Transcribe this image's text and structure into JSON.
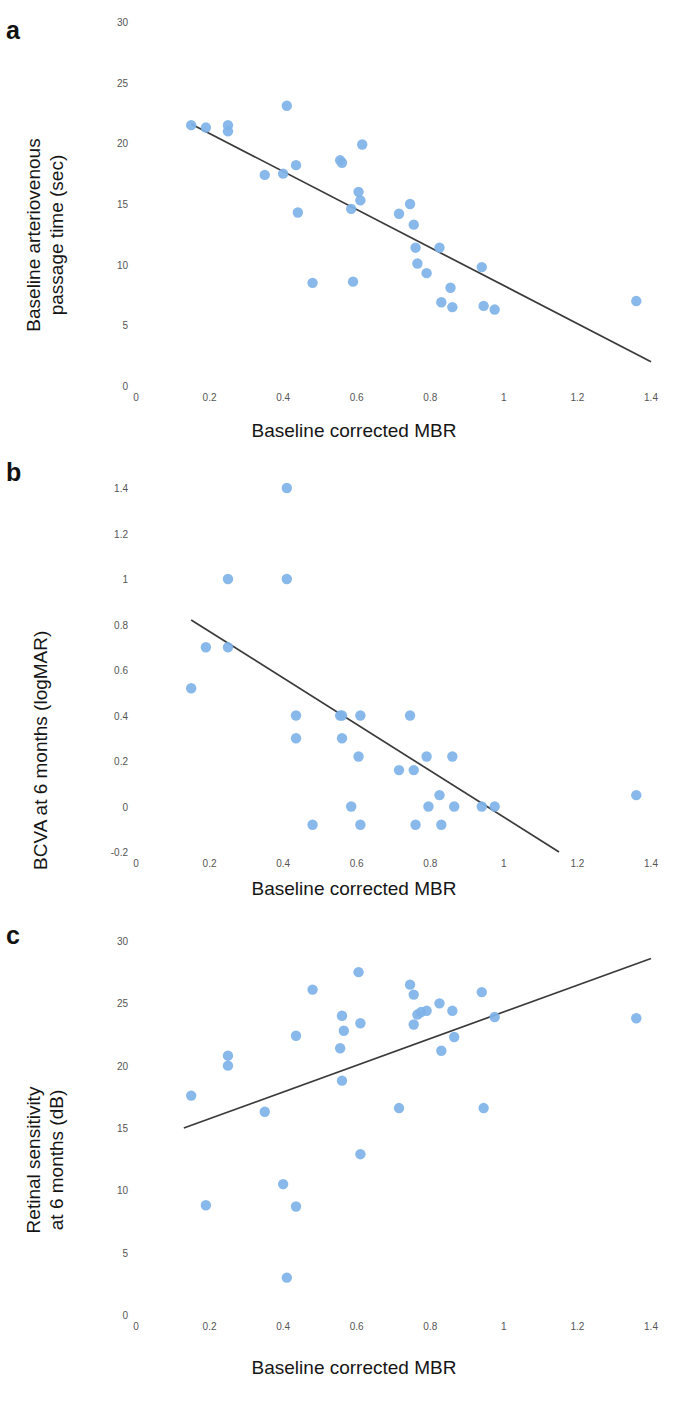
{
  "figure": {
    "marker_color": "#7FB3E8",
    "line_color": "#3a3a3a",
    "tick_color": "#555555",
    "text_color": "#151515"
  },
  "panels": [
    {
      "label": "a",
      "name": "panel-a",
      "chart_data": {
        "type": "scatter",
        "title": "",
        "xlabel": "Baseline corrected MBR",
        "ylabel": "Baseline arteriovenous passage time (sec)",
        "ylabel_lines": [
          "Baseline arteriovenous",
          "passage time (sec)"
        ],
        "xlim": [
          0,
          1.4
        ],
        "ylim": [
          0,
          30
        ],
        "xticks": [
          0,
          0.2,
          0.4,
          0.6,
          0.8,
          1,
          1.2,
          1.4
        ],
        "xticklabels": [
          "0",
          "0.2",
          "0.4",
          "0.6",
          "0.8",
          "1",
          "1.2",
          "1.4"
        ],
        "yticks": [
          0,
          5,
          10,
          15,
          20,
          25,
          30
        ],
        "yticklabels": [
          "0",
          "5",
          "10",
          "15",
          "20",
          "25",
          "30"
        ],
        "grid": false,
        "legend": "none",
        "points": [
          [
            0.15,
            21.5
          ],
          [
            0.19,
            21.3
          ],
          [
            0.25,
            21.5
          ],
          [
            0.25,
            21.0
          ],
          [
            0.35,
            17.4
          ],
          [
            0.4,
            17.5
          ],
          [
            0.41,
            23.1
          ],
          [
            0.435,
            18.2
          ],
          [
            0.44,
            14.3
          ],
          [
            0.48,
            8.5
          ],
          [
            0.555,
            18.6
          ],
          [
            0.56,
            18.4
          ],
          [
            0.585,
            14.6
          ],
          [
            0.59,
            8.6
          ],
          [
            0.605,
            16.0
          ],
          [
            0.61,
            15.3
          ],
          [
            0.615,
            19.9
          ],
          [
            0.715,
            14.2
          ],
          [
            0.745,
            15.0
          ],
          [
            0.755,
            13.3
          ],
          [
            0.76,
            11.4
          ],
          [
            0.765,
            10.1
          ],
          [
            0.79,
            9.3
          ],
          [
            0.825,
            11.4
          ],
          [
            0.83,
            6.9
          ],
          [
            0.855,
            8.1
          ],
          [
            0.86,
            6.5
          ],
          [
            0.94,
            9.8
          ],
          [
            0.945,
            6.6
          ],
          [
            0.975,
            6.3
          ],
          [
            1.36,
            7.0
          ]
        ],
        "fit_line": {
          "x1": 0.15,
          "y1": 21.6,
          "x2": 1.4,
          "y2": 2.0
        }
      }
    },
    {
      "label": "b",
      "name": "panel-b",
      "chart_data": {
        "type": "scatter",
        "title": "",
        "xlabel": "Baseline corrected MBR",
        "ylabel": "BCVA at 6 months (logMAR)",
        "ylabel_lines": [
          "BCVA at 6 months (logMAR)"
        ],
        "xlim": [
          0,
          1.4
        ],
        "ylim": [
          -0.2,
          1.4
        ],
        "xticks": [
          0,
          0.2,
          0.4,
          0.6,
          0.8,
          1,
          1.2,
          1.4
        ],
        "xticklabels": [
          "0",
          "0.2",
          "0.4",
          "0.6",
          "0.8",
          "1",
          "1.2",
          "1.4"
        ],
        "yticks": [
          -0.2,
          0,
          0.2,
          0.4,
          0.6,
          0.8,
          1,
          1.2,
          1.4
        ],
        "yticklabels": [
          "-0.2",
          "0",
          "0.2",
          "0.4",
          "0.6",
          "0.8",
          "1",
          "1.2",
          "1.4"
        ],
        "grid": false,
        "legend": "none",
        "points": [
          [
            0.15,
            0.52
          ],
          [
            0.19,
            0.7
          ],
          [
            0.25,
            1.0
          ],
          [
            0.25,
            0.7
          ],
          [
            0.41,
            1.4
          ],
          [
            0.41,
            1.0
          ],
          [
            0.435,
            0.4
          ],
          [
            0.435,
            0.3
          ],
          [
            0.48,
            -0.08
          ],
          [
            0.555,
            0.4
          ],
          [
            0.56,
            0.4
          ],
          [
            0.56,
            0.3
          ],
          [
            0.585,
            0.0
          ],
          [
            0.605,
            0.22
          ],
          [
            0.61,
            0.4
          ],
          [
            0.61,
            -0.08
          ],
          [
            0.715,
            0.16
          ],
          [
            0.745,
            0.4
          ],
          [
            0.755,
            0.16
          ],
          [
            0.76,
            -0.08
          ],
          [
            0.79,
            0.22
          ],
          [
            0.795,
            0.0
          ],
          [
            0.825,
            0.05
          ],
          [
            0.83,
            -0.08
          ],
          [
            0.86,
            0.22
          ],
          [
            0.865,
            0.0
          ],
          [
            0.94,
            0.0
          ],
          [
            0.975,
            0.0
          ],
          [
            1.36,
            0.05
          ]
        ],
        "fit_line": {
          "x1": 0.15,
          "y1": 0.82,
          "x2": 1.15,
          "y2": -0.2
        }
      }
    },
    {
      "label": "c",
      "name": "panel-c",
      "chart_data": {
        "type": "scatter",
        "title": "",
        "xlabel": "Baseline corrected MBR",
        "ylabel": "Retinal sensitivity at 6 months (dB)",
        "ylabel_lines": [
          "Retinal sensitivity",
          "at 6 months (dB)"
        ],
        "xlim": [
          0,
          1.4
        ],
        "ylim": [
          0,
          30
        ],
        "xticks": [
          0,
          0.2,
          0.4,
          0.6,
          0.8,
          1,
          1.2,
          1.4
        ],
        "xticklabels": [
          "0",
          "0.2",
          "0.4",
          "0.6",
          "0.8",
          "1",
          "1.2",
          "1.4"
        ],
        "yticks": [
          0,
          5,
          10,
          15,
          20,
          25,
          30
        ],
        "yticklabels": [
          "0",
          "5",
          "10",
          "15",
          "20",
          "25",
          "30"
        ],
        "grid": false,
        "legend": "none",
        "points": [
          [
            0.15,
            17.6
          ],
          [
            0.19,
            8.8
          ],
          [
            0.25,
            20.8
          ],
          [
            0.25,
            20.0
          ],
          [
            0.35,
            16.3
          ],
          [
            0.4,
            10.5
          ],
          [
            0.41,
            3.0
          ],
          [
            0.435,
            22.4
          ],
          [
            0.435,
            8.7
          ],
          [
            0.48,
            26.1
          ],
          [
            0.555,
            21.4
          ],
          [
            0.56,
            18.8
          ],
          [
            0.56,
            24.0
          ],
          [
            0.565,
            22.8
          ],
          [
            0.605,
            27.5
          ],
          [
            0.61,
            23.4
          ],
          [
            0.61,
            12.9
          ],
          [
            0.715,
            16.6
          ],
          [
            0.745,
            26.5
          ],
          [
            0.755,
            25.7
          ],
          [
            0.755,
            23.3
          ],
          [
            0.765,
            24.1
          ],
          [
            0.775,
            24.3
          ],
          [
            0.79,
            24.4
          ],
          [
            0.825,
            25.0
          ],
          [
            0.83,
            21.2
          ],
          [
            0.86,
            24.4
          ],
          [
            0.865,
            22.3
          ],
          [
            0.94,
            25.9
          ],
          [
            0.945,
            16.6
          ],
          [
            0.975,
            23.9
          ],
          [
            1.36,
            23.8
          ]
        ],
        "fit_line": {
          "x1": 0.13,
          "y1": 15.0,
          "x2": 1.4,
          "y2": 28.6
        }
      }
    }
  ]
}
